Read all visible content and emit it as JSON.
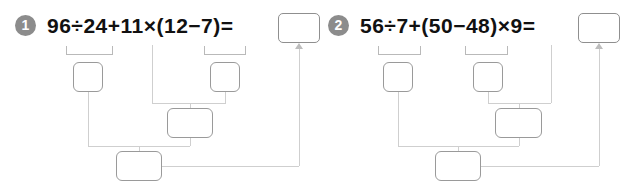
{
  "page": {
    "background_color": "#ffffff",
    "marker_color": "#8c8c8c",
    "box_border_color": "#9a9a9a",
    "connector_color": "#cfcfcf",
    "bracket_color": "#b9b9b9"
  },
  "problems": [
    {
      "number": "1",
      "expression": "96÷24+11×(12−7)=",
      "answer_box_value": "",
      "answer_box_placeholder": "",
      "steps": [
        {
          "label": "step-1-divide",
          "value": "",
          "source": "96÷24"
        },
        {
          "label": "step-1-subtract",
          "value": "",
          "source": "12−7"
        },
        {
          "label": "step-1-multiply",
          "value": "",
          "source": "11×(12−7)"
        },
        {
          "label": "step-1-add",
          "value": "",
          "source": "96÷24+11×(12−7)"
        }
      ]
    },
    {
      "number": "2",
      "expression": "56÷7+(50−48)×9=",
      "answer_box_value": "",
      "answer_box_placeholder": "",
      "steps": [
        {
          "label": "step-2-divide",
          "value": "",
          "source": "56÷7"
        },
        {
          "label": "step-2-subtract",
          "value": "",
          "source": "50−48"
        },
        {
          "label": "step-2-multiply",
          "value": "",
          "source": "(50−48)×9"
        },
        {
          "label": "step-2-add",
          "value": "",
          "source": "56÷7+(50−48)×9"
        }
      ]
    }
  ]
}
